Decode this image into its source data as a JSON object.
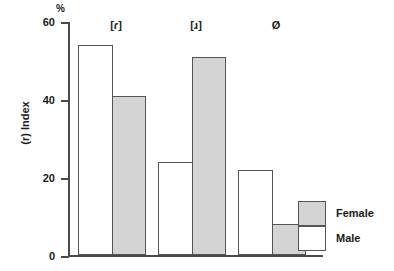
{
  "chart_data": {
    "type": "bar",
    "title": "",
    "subtitle": "",
    "xlabel": "",
    "ylabel": "(r) Index",
    "unit_label": "%",
    "ylim": [
      0,
      60
    ],
    "yticks": [
      0,
      20,
      40,
      60
    ],
    "ytick_labels": [
      "0",
      "20",
      "40",
      "60"
    ],
    "grid": false,
    "legend_position": "bottom-right",
    "categories": [
      "[ɾ]",
      "[ɹ]",
      "Ø"
    ],
    "series": [
      {
        "name": "Male",
        "color": "#ffffff",
        "values": [
          54,
          24,
          22
        ]
      },
      {
        "name": "Female",
        "color": "#d4d4d4",
        "values": [
          41,
          51,
          8
        ]
      }
    ]
  },
  "axis": {
    "unit": "%",
    "title": "(r) Index",
    "ticks": [
      {
        "label": "60",
        "value": 60
      },
      {
        "label": "40",
        "value": 40
      },
      {
        "label": "20",
        "value": 20
      },
      {
        "label": "0",
        "value": 0
      }
    ]
  },
  "categories": [
    {
      "label": "[ɾ]",
      "male": 54,
      "female": 41
    },
    {
      "label": "[ɹ]",
      "male": 24,
      "female": 51
    },
    {
      "label": "Ø",
      "male": 22,
      "female": 8
    }
  ],
  "legend": {
    "entries": [
      {
        "label": "Female",
        "swatch": "female"
      },
      {
        "label": "Male",
        "swatch": "male"
      }
    ]
  }
}
